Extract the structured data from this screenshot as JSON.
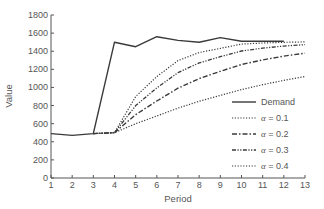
{
  "chart_data": {
    "type": "line",
    "title": "",
    "xlabel": "Period",
    "ylabel": "Value",
    "xlim": [
      1,
      13
    ],
    "ylim": [
      0,
      1800
    ],
    "x_ticks": [
      1,
      2,
      3,
      4,
      5,
      6,
      7,
      8,
      9,
      10,
      11,
      12,
      13
    ],
    "y_ticks": [
      0,
      200,
      400,
      600,
      800,
      1000,
      1200,
      1400,
      1600,
      1800
    ],
    "grid": false,
    "legend_position": "lower right (inside plot)",
    "series": [
      {
        "name": "Demand",
        "style": "solid",
        "x": [
          1,
          2,
          3,
          4,
          5,
          6,
          7,
          8,
          9,
          10,
          11,
          12
        ],
        "values": [
          490,
          470,
          490,
          1500,
          1450,
          1560,
          1520,
          1500,
          1550,
          1510,
          1510,
          1510
        ]
      },
      {
        "name": "α = 0.1",
        "style": "dotted",
        "x": [
          3,
          4,
          5,
          6,
          7,
          8,
          9,
          10,
          11,
          12,
          13
        ],
        "values": [
          490,
          500,
          600,
          685,
          772,
          847,
          912,
          976,
          1030,
          1078,
          1121
        ]
      },
      {
        "name": "α = 0.2",
        "style": "dash-dot",
        "x": [
          3,
          4,
          5,
          6,
          7,
          8,
          9,
          10,
          11,
          12,
          13
        ],
        "values": [
          490,
          500,
          700,
          850,
          992,
          1098,
          1178,
          1253,
          1304,
          1346,
          1378
        ]
      },
      {
        "name": "α = 0.3",
        "style": "dash-dot-dot",
        "x": [
          3,
          4,
          5,
          6,
          7,
          8,
          9,
          10,
          11,
          12,
          13
        ],
        "values": [
          490,
          500,
          800,
          995,
          1164,
          1271,
          1340,
          1403,
          1435,
          1457,
          1473
        ]
      },
      {
        "name": "α = 0.4",
        "style": "dotted",
        "x": [
          3,
          4,
          5,
          6,
          7,
          8,
          9,
          10,
          11,
          12,
          13
        ],
        "values": [
          490,
          500,
          900,
          1120,
          1296,
          1386,
          1431,
          1479,
          1491,
          1499,
          1503
        ]
      }
    ]
  },
  "legend": {
    "items": [
      {
        "label": "Demand"
      },
      {
        "prefix": "α",
        "label": " = 0.1"
      },
      {
        "prefix": "α",
        "label": " = 0.2"
      },
      {
        "prefix": "α",
        "label": " = 0.3"
      },
      {
        "prefix": "α",
        "label": " = 0.4"
      }
    ]
  },
  "colors": {
    "line": "#3a3a3a",
    "axis": "#555555",
    "text": "#555555"
  }
}
